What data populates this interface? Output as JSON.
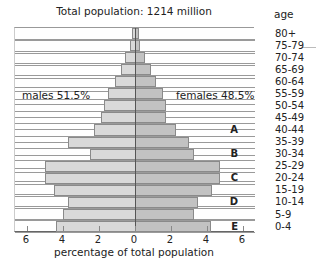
{
  "chart_data": {
    "type": "bar",
    "subtype": "population-pyramid",
    "title": "Total population: 1214 million",
    "xlabel": "percentage of total population",
    "ylabel": "age",
    "xlim": [
      -6,
      6
    ],
    "xticks": [
      "6",
      "4",
      "2",
      "0",
      "2",
      "4",
      "6"
    ],
    "grid": true,
    "annotations": [
      {
        "text": "males 51.5%",
        "side": "left"
      },
      {
        "text": "females 48.5%",
        "side": "right"
      }
    ],
    "row_markers": {
      "40-44": "A",
      "30-34": "B",
      "20-24": "C",
      "10-14": "D",
      "0-4": "E"
    },
    "categories": [
      "80+",
      "75-79",
      "70-74",
      "65-69",
      "60-64",
      "55-59",
      "50-54",
      "45-49",
      "40-44",
      "35-39",
      "30-34",
      "25-29",
      "20-24",
      "15-19",
      "10-14",
      "5-9",
      "0-4"
    ],
    "series": [
      {
        "name": "males",
        "color": "#d9d9d9",
        "values": [
          0.15,
          0.3,
          0.55,
          0.8,
          1.1,
          1.5,
          1.7,
          1.9,
          2.3,
          3.7,
          2.5,
          5.0,
          5.0,
          4.5,
          3.7,
          4.0,
          4.4
        ]
      },
      {
        "name": "females",
        "color": "#c2c2c2",
        "values": [
          0.2,
          0.3,
          0.55,
          0.9,
          1.15,
          1.55,
          1.7,
          1.7,
          2.3,
          3.0,
          3.3,
          4.7,
          4.7,
          4.3,
          3.5,
          3.3,
          4.2
        ]
      }
    ]
  }
}
